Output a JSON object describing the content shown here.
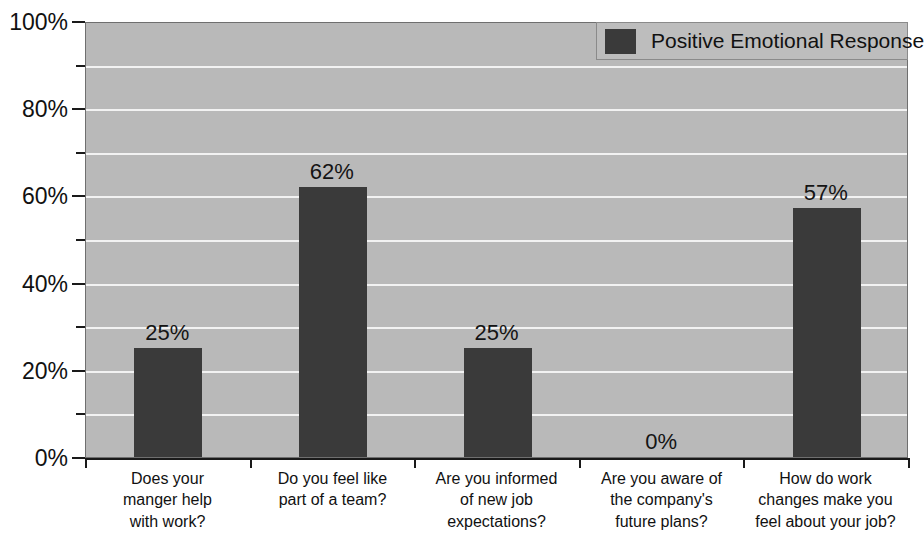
{
  "chart_data": {
    "type": "bar",
    "title": "",
    "xlabel": "",
    "ylabel": "",
    "ylim": [
      0,
      100
    ],
    "grid": true,
    "legend_position": "top-right",
    "categories": [
      "Does your manger help with work?",
      "Do you feel like part of a team?",
      "Are you informed of new job expectations?",
      "Are you aware of the company's future plans?",
      "How do work changes make you feel about your job?"
    ],
    "category_lines": [
      [
        "Does your",
        "manger help",
        "with work?"
      ],
      [
        "Do you feel like",
        "part of a team?"
      ],
      [
        "Are you informed",
        "of new job",
        "expectations?"
      ],
      [
        "Are you aware of",
        "the company's",
        "future plans?"
      ],
      [
        "How do work",
        "changes make you",
        "feel about your job?"
      ]
    ],
    "series": [
      {
        "name": "Positive Emotional Response",
        "values": [
          25,
          62,
          25,
          0,
          57
        ],
        "value_labels": [
          "25%",
          "62%",
          "25%",
          "0%",
          "57%"
        ],
        "color": "#3a3a3a"
      }
    ],
    "y_ticks_major": [
      0,
      20,
      40,
      60,
      80,
      100
    ],
    "y_tick_labels": [
      "0%",
      "20%",
      "40%",
      "60%",
      "80%",
      "100%"
    ],
    "y_ticks_minor": [
      10,
      30,
      50,
      70,
      90
    ],
    "gridlines_at": [
      10,
      20,
      30,
      40,
      50,
      60,
      70,
      80,
      90
    ]
  },
  "legend": {
    "label": "Positive Emotional Response"
  },
  "colors": {
    "plot_background": "#b9b9b9",
    "gridline": "#f2f2f2",
    "bar": "#3a3a3a",
    "axis": "#1a1a1a",
    "text": "#111111",
    "legend_background": "#bdbdbd"
  }
}
